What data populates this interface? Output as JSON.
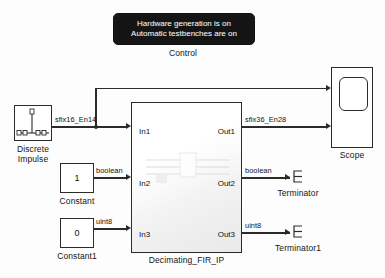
{
  "diagram": {
    "background": "#fdfdfd",
    "line_color": "#2b2b2b"
  },
  "control": {
    "name": "Control",
    "line1": "Hardware generation is on",
    "line2": "Automatic testbenches are on",
    "label": "Control",
    "background": "#141414",
    "text_color": "#f2f2f2"
  },
  "source": {
    "impulse_label_line1": "Discrete",
    "impulse_label_line2": "Impulse",
    "impulse_icon": "discrete-impulse-icon"
  },
  "constants": [
    {
      "value": "1",
      "label": "Constant",
      "signal": "boolean"
    },
    {
      "value": "0",
      "label": "Constant1",
      "signal": "uint8"
    }
  ],
  "subsystem": {
    "label": "Decimating_FIR_IP",
    "inputs": [
      "In1",
      "In2",
      "In3"
    ],
    "outputs": [
      "Out1",
      "Out2",
      "Out3"
    ]
  },
  "signals": {
    "in1": "sfix16_En14",
    "in2": "boolean",
    "in3": "uint8",
    "out1": "sfix36_En28",
    "out2": "boolean",
    "out3": "uint8"
  },
  "sinks": {
    "scope_label": "Scope",
    "terminator_label": "Terminator",
    "terminator1_label": "Terminator1"
  }
}
